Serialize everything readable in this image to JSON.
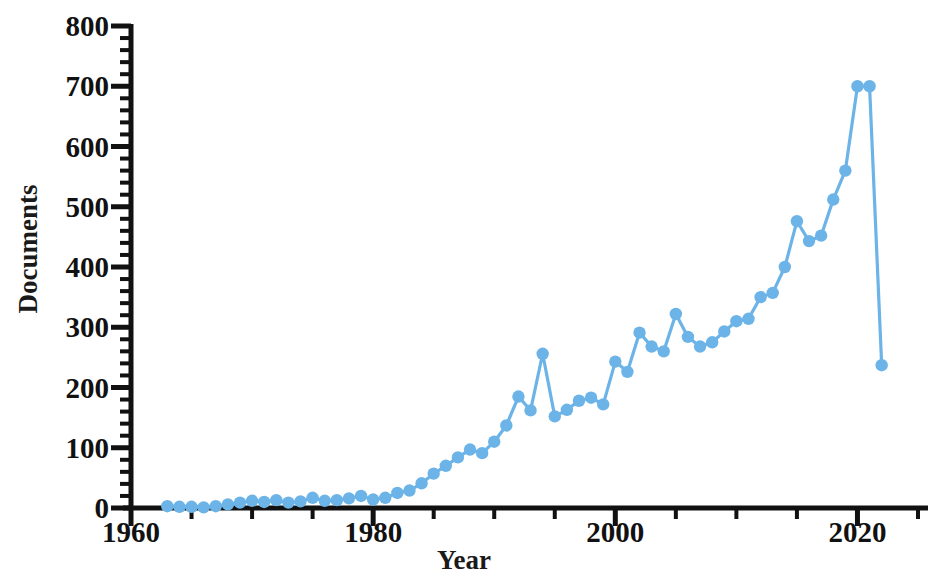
{
  "chart_data": {
    "type": "line",
    "title": "",
    "xlabel": "Year",
    "ylabel": "Documents",
    "xlim": [
      1960,
      2025
    ],
    "ylim": [
      0,
      800
    ],
    "x_major_ticks": [
      1960,
      1980,
      2000,
      2020
    ],
    "x_minor_step": 5,
    "y_major_ticks": [
      0,
      100,
      200,
      300,
      400,
      500,
      600,
      700,
      800
    ],
    "y_minor_step": 20,
    "grid": false,
    "legend": false,
    "series_color": "#6cb4e8",
    "marker": "circle",
    "x": [
      1963,
      1964,
      1965,
      1966,
      1967,
      1968,
      1969,
      1970,
      1971,
      1972,
      1973,
      1974,
      1975,
      1976,
      1977,
      1978,
      1979,
      1980,
      1981,
      1982,
      1983,
      1984,
      1985,
      1986,
      1987,
      1988,
      1989,
      1990,
      1991,
      1992,
      1993,
      1994,
      1995,
      1996,
      1997,
      1998,
      1999,
      2000,
      2001,
      2002,
      2003,
      2004,
      2005,
      2006,
      2007,
      2008,
      2009,
      2010,
      2011,
      2012,
      2013,
      2014,
      2015,
      2016,
      2017,
      2018,
      2019,
      2020,
      2021,
      2022
    ],
    "values": [
      3,
      2,
      2,
      1,
      3,
      6,
      9,
      12,
      10,
      13,
      9,
      11,
      17,
      12,
      13,
      16,
      20,
      14,
      17,
      25,
      29,
      41,
      57,
      70,
      84,
      97,
      91,
      110,
      137,
      185,
      162,
      256,
      152,
      163,
      178,
      183,
      172,
      243,
      226,
      291,
      268,
      260,
      322,
      284,
      268,
      275,
      293,
      310,
      314,
      350,
      357,
      400,
      476,
      443,
      452,
      512,
      560,
      700,
      700,
      237
    ],
    "series_name": "Documents per year"
  },
  "axis": {
    "y_tick_labels": [
      "800",
      "700",
      "600",
      "500",
      "400",
      "300",
      "200",
      "100",
      "0"
    ],
    "x_tick_labels": [
      "1960",
      "1980",
      "2000",
      "2020"
    ],
    "y_title": "Documents",
    "x_title": "Year"
  }
}
